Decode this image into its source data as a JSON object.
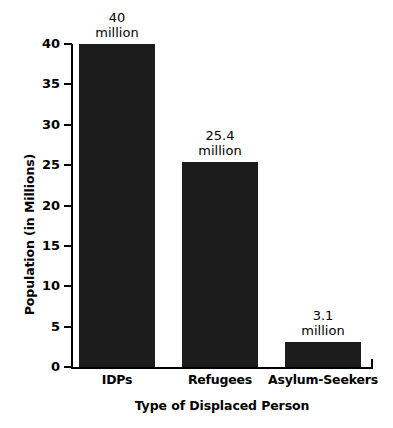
{
  "chart_data": {
    "type": "bar",
    "title": "",
    "xlabel": "Type of Displaced Person",
    "ylabel": "Population (in Millions)",
    "categories": [
      "IDPs",
      "Refugees",
      "Asylum-Seekers"
    ],
    "values": [
      40,
      25.4,
      3.1
    ],
    "value_labels": [
      {
        "number": "40",
        "unit": "million"
      },
      {
        "number": "25.4",
        "unit": "million"
      },
      {
        "number": "3.1",
        "unit": "million"
      }
    ],
    "ylim": [
      0,
      40
    ],
    "yticks": [
      "0",
      "5",
      "10",
      "15",
      "20",
      "25",
      "30",
      "35",
      "40"
    ],
    "ytick_values": [
      0,
      5,
      10,
      15,
      20,
      25,
      30,
      35,
      40
    ],
    "grid": false,
    "legend": null,
    "bar_color": "#1c1c1c",
    "axis_color": "#000000",
    "background": "#ffffff"
  }
}
